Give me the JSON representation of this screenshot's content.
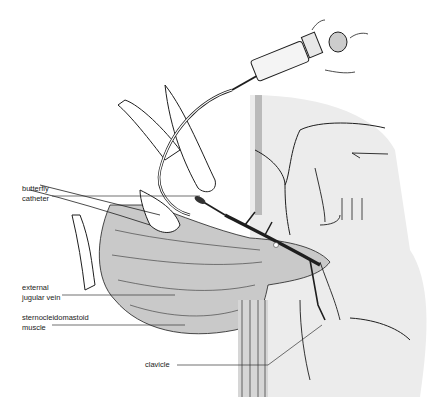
{
  "figure": {
    "type": "medical-illustration",
    "colors": {
      "line": "#1e1e1e",
      "muscle_fill": "#c9c9c9",
      "skin_shade": "#e4e4e4",
      "background": "#ffffff"
    }
  },
  "labels": [
    {
      "line1": "butterfly",
      "line2": "catheter"
    },
    {
      "line1": "external",
      "line2": "jugular vein"
    },
    {
      "line1": "sternocleidomastoid",
      "line2": "muscle"
    },
    {
      "line1": "clavicle",
      "line2": ""
    }
  ]
}
